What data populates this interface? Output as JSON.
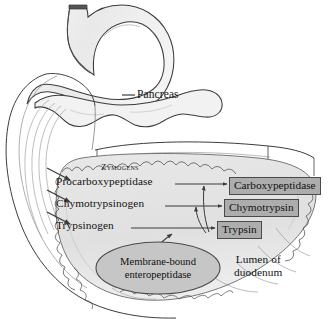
{
  "figure": {
    "background": "#ffffff"
  },
  "labels": {
    "pancreas": "Pancreas",
    "zymogens_heading": "Zymogens",
    "lumen_line1": "Lumen of",
    "lumen_line2": "duodenum"
  },
  "zymogens": [
    {
      "name": "Procarboxypeptidase"
    },
    {
      "name": "Chymotrypsinogen"
    },
    {
      "name": "Trypsinogen"
    }
  ],
  "enzymes": [
    {
      "name": "Carboxypeptidase"
    },
    {
      "name": "Chymotrypsin"
    },
    {
      "name": "Trypsin"
    }
  ],
  "activator": {
    "line1": "Membrane-bound",
    "line2": "enteropeptidase"
  },
  "colors": {
    "enzyme_box_fill": "#adadad",
    "enzyme_box_border": "#4a4a4a",
    "organ_fill": "#efefef",
    "duodenum_fill": "#e2e2e2",
    "ellipse_fill": "#c6c6c6",
    "outline": "#2b2b2b",
    "text": "#111111"
  }
}
